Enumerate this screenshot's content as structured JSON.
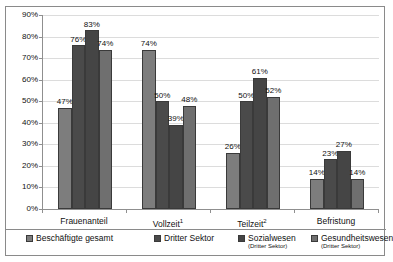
{
  "chart_data": {
    "type": "bar",
    "title": "",
    "xlabel": "",
    "ylabel": "",
    "ylim": [
      0,
      90
    ],
    "grid": true,
    "legend_position": "bottom",
    "categories": [
      "Frauenanteil",
      "Vollzeit¹",
      "Teilzeit²",
      "Befristung"
    ],
    "category_labels": [
      {
        "text": "Frauenanteil",
        "sup": ""
      },
      {
        "text": "Vollzeit",
        "sup": "1"
      },
      {
        "text": "Teilzeit",
        "sup": "2"
      },
      {
        "text": "Befristung",
        "sup": ""
      }
    ],
    "ytick_labels": [
      "90%",
      "80%",
      "70%",
      "60%",
      "50%",
      "40%",
      "30%",
      "20%",
      "10%",
      "0%"
    ],
    "ytick_values": [
      90,
      80,
      70,
      60,
      50,
      40,
      30,
      20,
      10,
      0
    ],
    "series": [
      {
        "name": "Beschäftigte gesamt",
        "sub": "",
        "color": "#7d7d7d",
        "values": [
          47,
          74,
          26,
          14
        ],
        "labels": [
          "47%",
          "74%",
          "26%",
          "14%"
        ]
      },
      {
        "name": "Dritter Sektor",
        "sub": "",
        "color": "#4a4a4a",
        "values": [
          76,
          50,
          50,
          23
        ],
        "labels": [
          "76%",
          "50%",
          "50%",
          "23%"
        ]
      },
      {
        "name": "Sozialwesen",
        "sub": "(Dritter Sektor)",
        "color": "#454545",
        "values": [
          83,
          39,
          61,
          27
        ],
        "labels": [
          "83%",
          "39%",
          "61%",
          "27%"
        ]
      },
      {
        "name": "Gesundheitswesen",
        "sub": "(Dritter Sektor)",
        "color": "#6f6f6f",
        "values": [
          74,
          48,
          52,
          14
        ],
        "labels": [
          "74%",
          "48%",
          "52%",
          "14%"
        ]
      }
    ]
  }
}
